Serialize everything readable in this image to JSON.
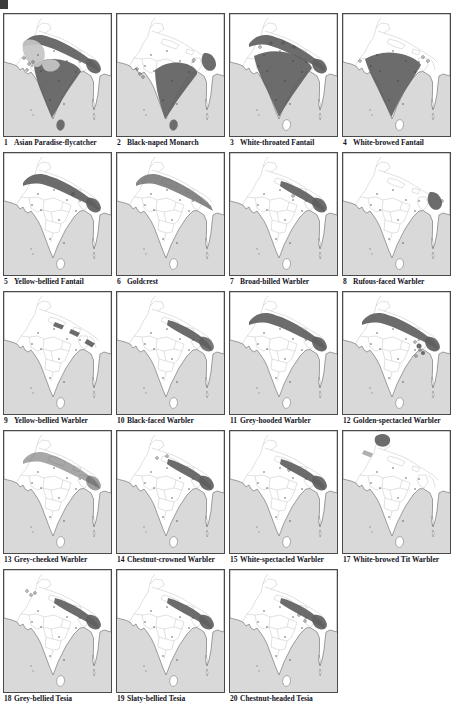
{
  "page": {
    "kind": "bird-field-guide-distribution-maps-plate"
  },
  "colors": {
    "sea": "#d9d9d9",
    "land": "#ffffff",
    "coast": "#7a7a7a",
    "boundary": "#bcbcbc",
    "range_dark": "#5f5f5f",
    "range_light": "#c6c6c6",
    "record_dot": "#3a3a3a",
    "caption": "#14141e",
    "map_border": "#4a4a4a"
  },
  "plate": {
    "maps": [
      {
        "num": "1",
        "name": "Asian Paradise-flycatcher",
        "range": "r1"
      },
      {
        "num": "2",
        "name": "Black-naped Monarch",
        "range": "r2"
      },
      {
        "num": "3",
        "name": "White-throated Fantail",
        "range": "r3"
      },
      {
        "num": "4",
        "name": "White-browed Fantail",
        "range": "r4"
      },
      {
        "num": "5",
        "name": "Yellow-bellied Fantail",
        "range": "r5"
      },
      {
        "num": "6",
        "name": "Goldcrest",
        "range": "r6"
      },
      {
        "num": "7",
        "name": "Broad-billed Warbler",
        "range": "r7"
      },
      {
        "num": "8",
        "name": "Rufous-faced Warbler",
        "range": "r8"
      },
      {
        "num": "9",
        "name": "Yellow-bellied Warbler",
        "range": "r9"
      },
      {
        "num": "10",
        "name": "Black-faced Warbler",
        "range": "r10"
      },
      {
        "num": "11",
        "name": "Grey-hooded Warbler",
        "range": "r11"
      },
      {
        "num": "12",
        "name": "Golden-spectacled Warbler",
        "range": "r12"
      },
      {
        "num": "13",
        "name": "Grey-cheeked Warbler",
        "range": "r13"
      },
      {
        "num": "14",
        "name": "Chestnut-crowned Warbler",
        "range": "r14"
      },
      {
        "num": "15",
        "name": "White-spectacled Warbler",
        "range": "r15"
      },
      {
        "num": "17",
        "name": "White-browed Tit Warbler",
        "range": "r17"
      },
      {
        "num": "18",
        "name": "Grey-bellied Tesia",
        "range": "r18"
      },
      {
        "num": "19",
        "name": "Slaty-bellied Tesia",
        "range": "r19"
      },
      {
        "num": "20",
        "name": "Chestnut-headed Tesia",
        "range": "r20"
      }
    ]
  }
}
